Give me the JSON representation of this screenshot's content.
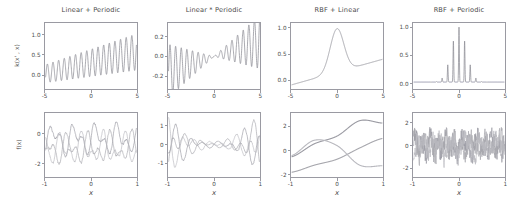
{
  "figure": {
    "kind": "gaussian-process-kernel-grid",
    "rows": 2,
    "cols": 4,
    "row_roles": [
      "kernel-function",
      "prior-samples"
    ]
  },
  "colors": {
    "kernel_line": "#8a8a93",
    "axis": "#9a9aa2",
    "text": "#4a4a4a",
    "sample_1": "#9b9ba3",
    "sample_2": "#a8a8ae",
    "sample_3": "#b9b9bf"
  },
  "panels": [
    {
      "id": "linear-plus-periodic",
      "title": "Linear + Periodic",
      "kernel": {
        "ylabel": "k(x' , x)",
        "xlabel": "",
        "yticks": [
          "0.0",
          "0.5",
          "1.0"
        ],
        "ytick_vals": [
          0.0,
          0.5,
          1.0
        ],
        "xticks": [
          "-5",
          "0",
          "5"
        ],
        "xtick_vals": [
          -5,
          0,
          5
        ],
        "xlim": [
          -5,
          5
        ],
        "ylim": [
          -0.35,
          1.3
        ],
        "form": "linear_plus_periodic",
        "period": 0.62,
        "amplitude": 0.42,
        "slope": 0.055,
        "intercept": 0.3
      },
      "samples": {
        "ylabel": "f(x)",
        "xlabel": "x",
        "yticks": [
          "-2",
          "0"
        ],
        "ytick_vals": [
          -2,
          0
        ],
        "xticks": [
          "-1",
          "0",
          "1"
        ],
        "xtick_vals": [
          -1,
          0,
          1
        ],
        "xlim": [
          -1,
          1
        ],
        "ylim": [
          -2.9,
          1.4
        ],
        "style": "periodic_wavy",
        "n_series": 3,
        "period": 0.47,
        "amp": 1.25,
        "offsets": [
          -0.35,
          -0.95,
          -1.0
        ],
        "phases": [
          0.0,
          2.1,
          4.2
        ],
        "noise": 0.12
      }
    },
    {
      "id": "linear-times-periodic",
      "title": "Linear * Periodic",
      "kernel": {
        "ylabel": "",
        "xlabel": "",
        "yticks": [
          "-0.2",
          "0.0",
          "0.2"
        ],
        "ytick_vals": [
          -0.2,
          0.0,
          0.2
        ],
        "xticks": [
          "-5",
          "0",
          "5"
        ],
        "xtick_vals": [
          -5,
          0,
          5
        ],
        "xlim": [
          -5,
          5
        ],
        "ylim": [
          -0.33,
          0.34
        ],
        "form": "linear_times_periodic",
        "period": 0.62,
        "amplitude": 0.055,
        "slope": 0.03
      },
      "samples": {
        "ylabel": "",
        "xlabel": "x",
        "yticks": [
          "-1",
          "0",
          "1"
        ],
        "ytick_vals": [
          -1,
          0,
          1
        ],
        "xticks": [
          "-1",
          "0",
          "1"
        ],
        "xtick_vals": [
          -1,
          0,
          1
        ],
        "xlim": [
          -1,
          1
        ],
        "ylim": [
          -1.75,
          1.7
        ],
        "style": "periodic_growing_edges",
        "n_series": 3,
        "period": 0.3,
        "amp": 1.45,
        "phases": [
          0.0,
          1.9,
          3.9
        ],
        "noise": 0.1
      }
    },
    {
      "id": "rbf-plus-linear",
      "title": "RBF + Linear",
      "kernel": {
        "ylabel": "",
        "xlabel": "",
        "yticks": [
          "0.0",
          "0.5",
          "1.0"
        ],
        "ytick_vals": [
          0.0,
          0.5,
          1.0
        ],
        "xticks": [
          "-5",
          "0",
          "5"
        ],
        "xtick_vals": [
          -5,
          0,
          5
        ],
        "xlim": [
          -5,
          5
        ],
        "ylim": [
          -0.17,
          1.1
        ],
        "form": "rbf_plus_linear",
        "rbf_width": 0.75,
        "rbf_peak": 0.85,
        "slope": 0.05,
        "intercept": 0.15
      },
      "samples": {
        "ylabel": "",
        "xlabel": "x",
        "yticks": [
          "-2",
          "0",
          "2"
        ],
        "ytick_vals": [
          -2,
          0,
          2
        ],
        "xticks": [
          "-1",
          "0",
          "1"
        ],
        "xtick_vals": [
          -1,
          0,
          1
        ],
        "xlim": [
          -1,
          1
        ],
        "ylim": [
          -2.2,
          3.1
        ],
        "style": "smooth",
        "n_series": 3,
        "series": [
          {
            "name": "sample-1",
            "ctrl": [
              -0.55,
              0.55,
              1.2,
              2.5,
              2.3
            ]
          },
          {
            "name": "sample-2",
            "ctrl": [
              -1.85,
              -1.25,
              -0.75,
              0.2,
              1.0
            ]
          },
          {
            "name": "sample-3",
            "ctrl": [
              -0.45,
              0.85,
              0.4,
              -1.25,
              -1.3
            ]
          }
        ]
      }
    },
    {
      "id": "rbf-plus-periodic",
      "title": "RBF + Periodic",
      "kernel": {
        "ylabel": "",
        "xlabel": "",
        "yticks": [
          "0.0",
          "0.5",
          "1.0"
        ],
        "ytick_vals": [
          0.0,
          0.5,
          1.0
        ],
        "xticks": [
          "-5",
          "0",
          "5"
        ],
        "xtick_vals": [
          -5,
          0,
          5
        ],
        "xlim": [
          -5,
          5
        ],
        "ylim": [
          -0.1,
          1.08
        ],
        "form": "rbf_times_periodic_spikes",
        "spike_peak": 1.0,
        "side_peak": 0.3,
        "period": 0.62,
        "envelope_width": 0.55
      },
      "samples": {
        "ylabel": "",
        "xlabel": "x",
        "yticks": [
          "-2",
          "0",
          "2"
        ],
        "ytick_vals": [
          -2,
          0,
          2
        ],
        "xticks": [
          "-1",
          "0",
          "1"
        ],
        "xtick_vals": [
          -1,
          0,
          1
        ],
        "xlim": [
          -1,
          1
        ],
        "ylim": [
          -2.8,
          2.9
        ],
        "style": "rough_noisy",
        "n_series": 3,
        "amp": 1.1,
        "noise": 0.55,
        "phases": [
          0.0,
          2.4,
          4.6
        ]
      }
    }
  ],
  "chart_data": {
    "type": "line",
    "title": "",
    "grid": false,
    "legend": "none",
    "panels": [
      {
        "title": "Linear + Periodic",
        "row": "kernel",
        "xlabel": "",
        "ylabel": "k(x' , x)",
        "xlim": [
          -5,
          5
        ],
        "ylim": [
          -0.35,
          1.3
        ],
        "xticks": [
          -5,
          0,
          5
        ],
        "yticks": [
          0.0,
          0.5,
          1.0
        ],
        "description": "Rapid oscillation whose mean and amplitude grow linearly from left to right; minima near -0.3 at x=-5 rising to ~0.6, maxima from ~0.5 at x=-5 up to ~1.25 at x=5."
      },
      {
        "title": "Linear * Periodic",
        "row": "kernel",
        "xlabel": "",
        "ylabel": "",
        "xlim": [
          -5,
          5
        ],
        "ylim": [
          -0.33,
          0.34
        ],
        "xticks": [
          -5,
          0,
          5
        ],
        "yticks": [
          -0.2,
          0.0,
          0.2
        ],
        "description": "Oscillation with amplitude proportional to |x|: large (+/-0.28) at x=-5, collapsing to near zero at x=0, growing again to +0.3 at x=5 while drifting upward."
      },
      {
        "title": "RBF + Linear",
        "row": "kernel",
        "xlabel": "",
        "ylabel": "",
        "xlim": [
          -5,
          5
        ],
        "ylim": [
          -0.17,
          1.1
        ],
        "xticks": [
          -5,
          0,
          5
        ],
        "yticks": [
          0.0,
          0.5,
          1.0
        ],
        "description": "Gentle linear ramp from -0.12 at x=-5 with a sharp Gaussian bump peaking at 1.0 at x=0, settling to ~0.15 then rising linearly to 0.4 at x=5."
      },
      {
        "title": "RBF + Periodic",
        "row": "kernel",
        "xlabel": "",
        "ylabel": "",
        "xlim": [
          -5,
          5
        ],
        "ylim": [
          -0.1,
          1.08
        ],
        "xticks": [
          -5,
          0,
          5
        ],
        "yticks": [
          0.0,
          0.5,
          1.0
        ],
        "description": "Flat near 0 everywhere except a narrow spike train at the origin: central spike 1.0 flanked by two spikes ~0.3 at x=-0.6 and x=0.6."
      },
      {
        "title": "Linear + Periodic",
        "row": "samples",
        "xlabel": "x",
        "ylabel": "f(x)",
        "xlim": [
          -1,
          1
        ],
        "ylim": [
          -2.9,
          1.4
        ],
        "xticks": [
          -1,
          0,
          1
        ],
        "yticks": [
          -2,
          0
        ],
        "n_series": 3,
        "description": "Three wiggly periodic sample paths, period ~0.47, amplitude ~1.2, vertically offset and phase shifted, spanning roughly -2.6 to +1.2."
      },
      {
        "title": "Linear * Periodic",
        "row": "samples",
        "xlabel": "x",
        "ylabel": "",
        "xlim": [
          -1,
          1
        ],
        "ylim": [
          -1.75,
          1.7
        ],
        "xticks": [
          -1,
          0,
          1
        ],
        "yticks": [
          -1,
          0,
          1
        ],
        "n_series": 3,
        "description": "Three periodic sample paths pinched to near zero at x=0 and fanning out to +/-1.5 at both edges."
      },
      {
        "title": "RBF + Linear",
        "row": "samples",
        "xlabel": "x",
        "ylabel": "",
        "xlim": [
          -1,
          1
        ],
        "ylim": [
          -2.2,
          3.1
        ],
        "xticks": [
          -1,
          0,
          1
        ],
        "yticks": [
          -2,
          0,
          2
        ],
        "n_series": 3,
        "description": "Three very smooth sample paths: one rising from -0.6 to a 2.6 maximum near x=0.7, one rising monotonically from -1.9 to 1.0, one arching up to 0.9 near x=-0.5 then falling to -1.3."
      },
      {
        "title": "RBF + Periodic",
        "row": "samples",
        "xlabel": "x",
        "ylabel": "",
        "xlim": [
          -1,
          1
        ],
        "ylim": [
          -2.8,
          2.9
        ],
        "xticks": [
          -1,
          0,
          1
        ],
        "yticks": [
          -2,
          0,
          2
        ],
        "n_series": 3,
        "description": "Three rough, high-frequency noisy sample paths hovering around 0 with excursions to +2.6 and -2.4."
      }
    ]
  }
}
